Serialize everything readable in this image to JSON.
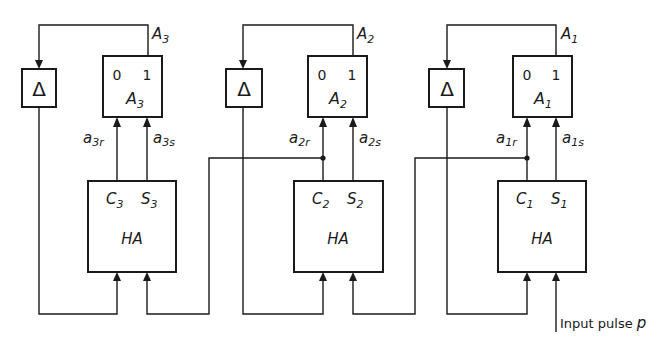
{
  "diagram": {
    "type": "block-diagram",
    "colors": {
      "line": "#1a1a1a",
      "background": "#ffffff"
    },
    "stages": [
      {
        "id": "stage3",
        "delay": {
          "symbol": "Δ"
        },
        "flipflop": {
          "label": "A",
          "sub": "3",
          "state0": "0",
          "state1": "1",
          "output_label": "A",
          "output_sub": "3"
        },
        "inputs": {
          "reset_label": "a",
          "reset_sub": "3r",
          "set_label": "a",
          "set_sub": "3s"
        },
        "half_adder": {
          "label": "HA",
          "carry": "C",
          "carry_sub": "3",
          "sum": "S",
          "sum_sub": "3"
        }
      },
      {
        "id": "stage2",
        "delay": {
          "symbol": "Δ"
        },
        "flipflop": {
          "label": "A",
          "sub": "2",
          "state0": "0",
          "state1": "1",
          "output_label": "A",
          "output_sub": "2"
        },
        "inputs": {
          "reset_label": "a",
          "reset_sub": "2r",
          "set_label": "a",
          "set_sub": "2s"
        },
        "half_adder": {
          "label": "HA",
          "carry": "C",
          "carry_sub": "2",
          "sum": "S",
          "sum_sub": "2"
        }
      },
      {
        "id": "stage1",
        "delay": {
          "symbol": "Δ"
        },
        "flipflop": {
          "label": "A",
          "sub": "1",
          "state0": "0",
          "state1": "1",
          "output_label": "A",
          "output_sub": "1"
        },
        "inputs": {
          "reset_label": "a",
          "reset_sub": "1r",
          "set_label": "a",
          "set_sub": "1s"
        },
        "half_adder": {
          "label": "HA",
          "carry": "C",
          "carry_sub": "1",
          "sum": "S",
          "sum_sub": "1"
        }
      }
    ],
    "input": {
      "label": "Input pulse ",
      "var": "p"
    }
  }
}
